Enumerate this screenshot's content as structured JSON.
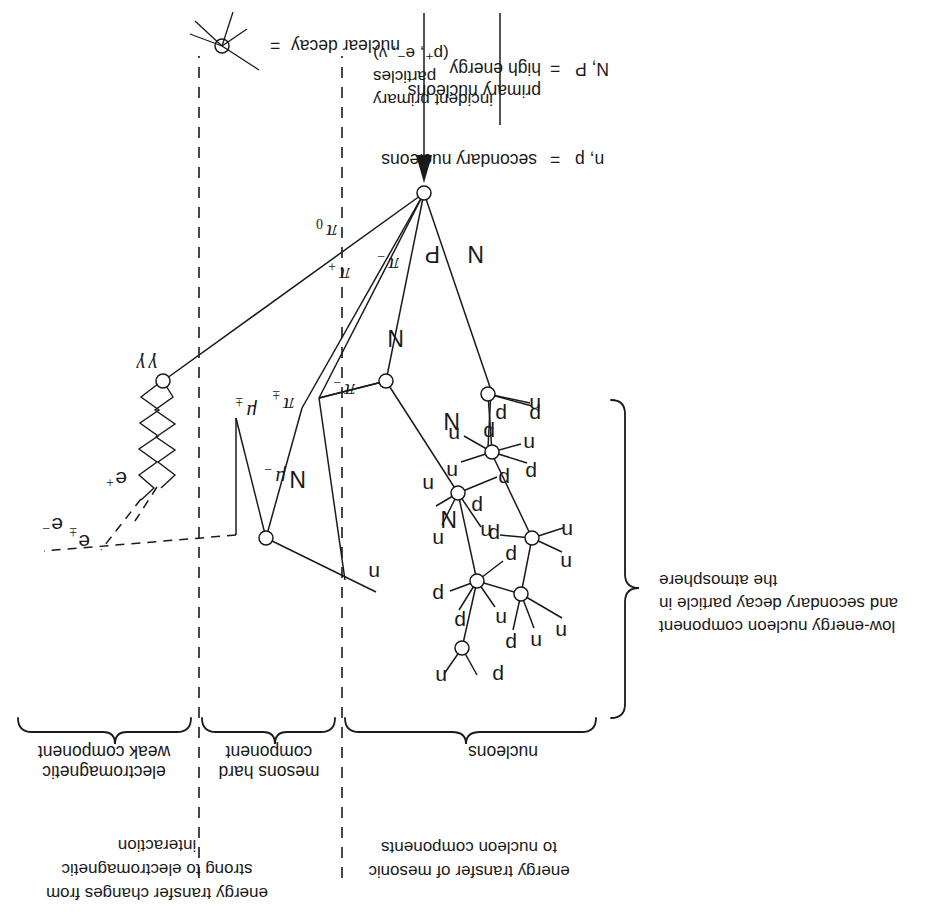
{
  "figure": {
    "orientation_deg": 180,
    "background": "#ffffff",
    "ink": "#1a1a1a"
  },
  "incident": {
    "line1": "incident primary",
    "line2": "particles",
    "line3": "(p⁺, e⁻, ν)"
  },
  "columns": [
    {
      "id": "nucleons",
      "bracket_label": "nucleons",
      "note": ""
    },
    {
      "id": "mesons",
      "bracket_label_1": "mesons hard",
      "bracket_label_2": "component"
    },
    {
      "id": "em",
      "bracket_label_1": "electromagnetic",
      "bracket_label_2": "weak component"
    }
  ],
  "annotations": {
    "transfer_meson": {
      "line1": "energy transfer of mesonic",
      "line2": "to nucleon components"
    },
    "transfer_em": {
      "line1": "energy transfer changes from",
      "line2": "strong to electromagnetic",
      "line3": "interaction"
    },
    "low_energy": {
      "line1": "low-energy nucleon component",
      "line2": "and secondary decay particle in",
      "line3": "the atmosphere"
    }
  },
  "legend": [
    {
      "symbol": "N, P",
      "equals": "=",
      "line1": "high energy",
      "line2": "primary nucleons"
    },
    {
      "symbol": "n, p",
      "equals": "=",
      "line1": "secondary nucleons",
      "line2": ""
    },
    {
      "symbol": "star-vertex-icon",
      "equals": "=",
      "line1": "nuclear decay",
      "line2": ""
    }
  ],
  "particle_labels": {
    "primary_nucleon": "N",
    "primary_proton": "P",
    "neutron": "n",
    "proton": "p",
    "pi_minus": "π",
    "pi_plus": "π",
    "pi_zero": "π",
    "pi_pm": "π",
    "mu_minus": "μ",
    "mu_pm": "μ",
    "gamma": "γ",
    "electron_pm": "e",
    "electron_plus": "e",
    "electron_minus": "e",
    "sub_minus": "−",
    "sub_plus": "+",
    "sub_pm": "±",
    "sub_zero": "0"
  },
  "shower_nodes": [
    {
      "id": "v0",
      "x": 523,
      "y": 725,
      "kind": "first-interaction"
    },
    {
      "id": "v1",
      "x": 561,
      "y": 537,
      "kind": "nuclear-decay"
    },
    {
      "id": "v2",
      "x": 489,
      "y": 425,
      "kind": "nuclear-decay"
    },
    {
      "id": "v3",
      "x": 470,
      "y": 337,
      "kind": "nuclear-decay"
    },
    {
      "id": "v4",
      "x": 485,
      "y": 270,
      "kind": "nuclear-decay"
    },
    {
      "id": "v5",
      "x": 455,
      "y": 466,
      "kind": "nuclear-decay"
    },
    {
      "id": "v6",
      "x": 459,
      "y": 524,
      "kind": "nuclear-decay"
    },
    {
      "id": "v7",
      "x": 415,
      "y": 380,
      "kind": "nuclear-decay"
    },
    {
      "id": "v8",
      "x": 426,
      "y": 324,
      "kind": "nuclear-decay"
    },
    {
      "id": "v9",
      "x": 681,
      "y": 380,
      "kind": "pion-decay"
    },
    {
      "id": "v10",
      "x": 784,
      "y": 537,
      "kind": "pair-production"
    }
  ]
}
